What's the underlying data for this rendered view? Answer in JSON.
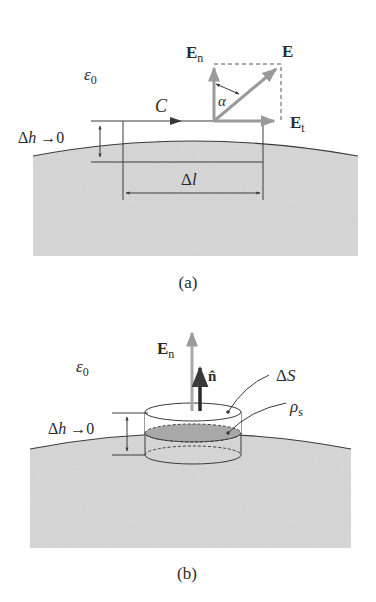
{
  "figure_a": {
    "caption": "(a)",
    "medium_label": "ε",
    "medium_sub": "0",
    "path_label": "C",
    "height_label": "Δh →0",
    "length_label": "Δl",
    "field_total": "E",
    "field_normal": "E",
    "field_normal_sub": "n",
    "field_tangential": "E",
    "field_tangential_sub": "t",
    "angle_label": "α"
  },
  "figure_b": {
    "caption": "(b)",
    "medium_label": "ε",
    "medium_sub": "0",
    "height_label": "Δh →0",
    "field_normal": "E",
    "field_normal_sub": "n",
    "normal_unit": "n̂",
    "surface_label": "ΔS",
    "charge_label": "ρ",
    "charge_sub": "s"
  },
  "colors": {
    "region_fill": "#d6d6d6",
    "line": "#3a3a3a",
    "vector_gray": "#9a9a9a",
    "charge_disk": "#a8a8a8"
  }
}
